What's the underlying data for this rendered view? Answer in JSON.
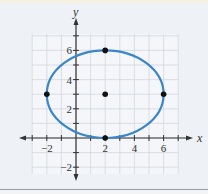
{
  "chart_data": {
    "type": "scatter",
    "title": "",
    "xlabel": "x",
    "ylabel": "y",
    "xlim": [
      -3,
      7
    ],
    "ylim": [
      -2.5,
      7
    ],
    "grid": true,
    "x_ticks": [
      -2,
      2,
      4,
      6
    ],
    "y_ticks": [
      -2,
      2,
      4,
      6
    ],
    "x_tick_labels": [
      "−2",
      "2",
      "4",
      "6"
    ],
    "y_tick_labels": [
      "−2",
      "2",
      "4",
      "6"
    ],
    "curve": {
      "type": "ellipse",
      "center": [
        2,
        3
      ],
      "semi_axis_x": 4,
      "semi_axis_y": 3,
      "color": "#3a86c8"
    },
    "points": [
      {
        "x": 2,
        "y": 3,
        "label": "center"
      },
      {
        "x": -2,
        "y": 3,
        "label": "vertex-left"
      },
      {
        "x": 6,
        "y": 3,
        "label": "vertex-right"
      },
      {
        "x": 2,
        "y": 6,
        "label": "co-vertex-top"
      },
      {
        "x": 2,
        "y": 0,
        "label": "co-vertex-bottom"
      }
    ]
  }
}
